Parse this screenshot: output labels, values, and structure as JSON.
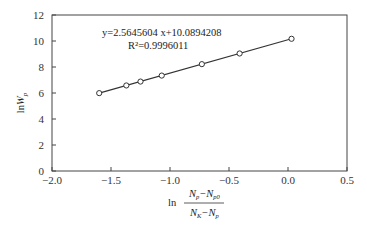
{
  "chart_data": {
    "type": "scatter",
    "title": "",
    "xlabel": "ln (N_p - N_p0)/(N_K - N_p)",
    "ylabel": "lnW_p",
    "xlim": [
      -2.0,
      0.5
    ],
    "ylim": [
      0,
      12
    ],
    "x_ticks": [
      "-2.0",
      "-1.5",
      "-1.0",
      "-0.5",
      "0.0",
      "0.5"
    ],
    "y_ticks": [
      "0",
      "2",
      "4",
      "6",
      "8",
      "10",
      "12"
    ],
    "grid": false,
    "legend": null,
    "series": [
      {
        "name": "data",
        "marker": "open-circle",
        "x": [
          -1.6,
          -1.37,
          -1.25,
          -1.07,
          -0.73,
          -0.41,
          0.03
        ],
        "y": [
          5.99,
          6.58,
          6.88,
          7.34,
          8.22,
          9.04,
          10.17
        ]
      },
      {
        "name": "linear fit",
        "line": true,
        "x": [
          -1.6,
          0.03
        ],
        "y": [
          5.99,
          10.17
        ]
      }
    ],
    "annotations": {
      "equation": "y=2.5645604 x+10.0894208",
      "r_squared": "R²=0.9996011"
    }
  },
  "labels": {
    "equation": "y=2.5645604 x+10.0894208",
    "r2": "R²=0.9996011",
    "ylabel_ln": "ln",
    "ylabel_w": "W",
    "ylabel_sub": "p",
    "xlabel_ln": "ln"
  }
}
